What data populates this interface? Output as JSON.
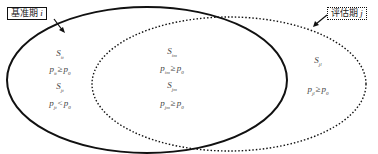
{
  "labels": {
    "base_period": {
      "text": "基准期",
      "var": "i"
    },
    "eval_period": {
      "text": "评估期",
      "var": "j"
    }
  },
  "regions": {
    "left": [
      {
        "set": {
          "base": "S",
          "sub": "it"
        }
      },
      {
        "lhs": {
          "base": "p",
          "sub": "it"
        },
        "op": "≥",
        "rhs": {
          "base": "p",
          "sub": "0"
        }
      },
      {
        "set": {
          "base": "S",
          "sub": "jt"
        }
      },
      {
        "lhs": {
          "base": "p",
          "sub": "jt"
        },
        "op": "<",
        "rhs": {
          "base": "p",
          "sub": "0"
        }
      }
    ],
    "middle": [
      {
        "set": {
          "base": "S",
          "sub": "im"
        }
      },
      {
        "lhs": {
          "base": "p",
          "sub": "im"
        },
        "op": "≥",
        "rhs": {
          "base": "p",
          "sub": "0"
        }
      },
      {
        "set": {
          "base": "S",
          "sub": "jm"
        }
      },
      {
        "lhs": {
          "base": "p",
          "sub": "jm"
        },
        "op": "≥",
        "rhs": {
          "base": "p",
          "sub": "0"
        }
      }
    ],
    "right": [
      {
        "set": {
          "base": "S",
          "sub": "jl"
        }
      },
      {
        "lhs": {
          "base": "p",
          "sub": "jl"
        },
        "op": "≥",
        "rhs": {
          "base": "p",
          "sub": "0"
        }
      }
    ]
  },
  "colors": {
    "stroke": "#111111",
    "text": "#444444"
  }
}
